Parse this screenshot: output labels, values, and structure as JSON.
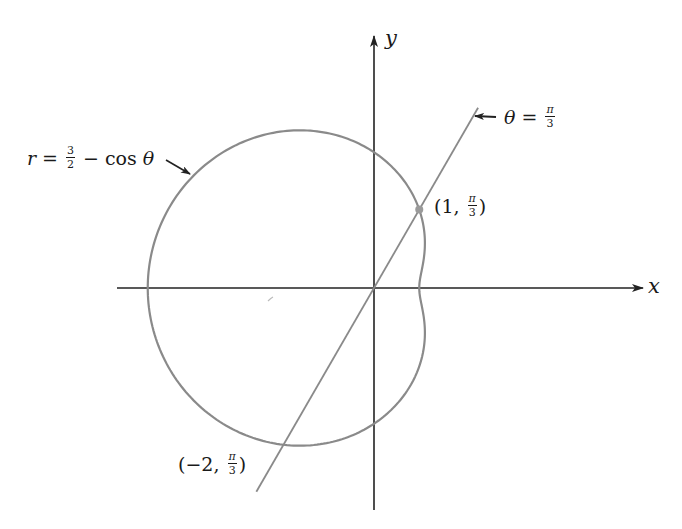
{
  "diagram": {
    "colors": {
      "axis": "#222222",
      "curve": "#8a8a8a",
      "line": "#8a8a8a",
      "point": "#9a9a9a",
      "text": "#1a1a1a"
    },
    "geometry": {
      "origin_px": [
        374,
        288
      ],
      "scale_px_per_unit": 90.5,
      "x_axis_px": [
        117,
        643
      ],
      "y_axis_px": [
        510,
        36
      ],
      "line_theta_rad": 1.0471975512,
      "line_r_range": [
        -2.6,
        2.3
      ]
    },
    "axes": {
      "x_label": "x",
      "y_label": "y"
    },
    "curve": {
      "equation": "r = 3/2 − cos θ",
      "label_r": "r",
      "label_eq": "=",
      "label_frac_num": "3",
      "label_frac_den": "2",
      "label_minus": "−",
      "label_cos": "cos",
      "label_theta": "θ",
      "a": 1.5,
      "b": -1
    },
    "line": {
      "equation": "θ = π/3",
      "label_theta": "θ",
      "label_eq": "=",
      "label_frac_num": "π",
      "label_frac_den": "3"
    },
    "points": [
      {
        "name": "point-1-pi-3",
        "polar": [
          1,
          "π/3"
        ],
        "label_open": "(",
        "label_r": "1",
        "label_comma": ",",
        "label_frac_num": "π",
        "label_frac_den": "3",
        "label_close": ")",
        "marked": true
      },
      {
        "name": "point-neg2-pi-3",
        "polar": [
          -2,
          "π/3"
        ],
        "label_open": "(",
        "label_r": "−2",
        "label_comma": ",",
        "label_frac_num": "π",
        "label_frac_den": "3",
        "label_close": ")",
        "marked": false
      }
    ]
  }
}
